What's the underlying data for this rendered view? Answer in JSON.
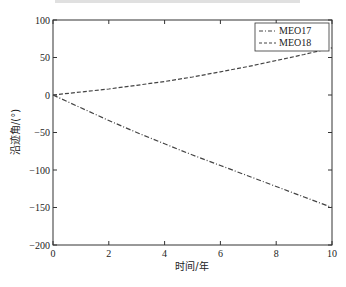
{
  "chart_data": {
    "type": "line",
    "title": "",
    "xlabel": "时间/年",
    "ylabel": "沿迹角/(°)",
    "xlim": [
      0,
      10
    ],
    "ylim": [
      -200,
      100
    ],
    "xticks": [
      0,
      2,
      4,
      6,
      8,
      10
    ],
    "yticks": [
      100,
      50,
      0,
      -50,
      -100,
      -150,
      -200
    ],
    "grid": false,
    "legend_position": "upper right",
    "x": [
      0,
      1,
      2,
      3,
      4,
      5,
      6,
      7,
      8,
      9,
      10
    ],
    "series": [
      {
        "name": "MEO17",
        "style": "dash-dot",
        "values": [
          0,
          -17,
          -34,
          -50,
          -65,
          -80,
          -94,
          -108,
          -122,
          -136,
          -150
        ]
      },
      {
        "name": "MEO18",
        "style": "dashed",
        "values": [
          0,
          4,
          8,
          13,
          18,
          24,
          31,
          38,
          46,
          54,
          63
        ]
      }
    ]
  },
  "legend": {
    "items": [
      "MEO17",
      "MEO18"
    ]
  },
  "axes": {
    "xlabel": "时间/年",
    "ylabel": "沿迹角/(°)",
    "xtick_labels": [
      "0",
      "2",
      "4",
      "6",
      "8",
      "10"
    ],
    "ytick_labels": [
      "100",
      "50",
      "0",
      "−50",
      "−100",
      "−150",
      "−200"
    ]
  }
}
